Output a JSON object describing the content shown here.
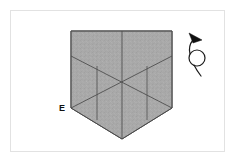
{
  "figure": {
    "background_color": "#ffffff",
    "frame_color": "#e2e2e2"
  },
  "shape": {
    "name": "folded-paper-outline",
    "fill_color": "#a8a8a8",
    "fill_texture": "noise-speckle",
    "stroke_color": "#4a4a4a",
    "outline_points": "71,31 172,31 172,108 122,139 71,108",
    "vertices": [
      {
        "id": "top-left",
        "x": 71,
        "y": 31
      },
      {
        "id": "top-right",
        "x": 172,
        "y": 31
      },
      {
        "id": "right",
        "x": 172,
        "y": 108
      },
      {
        "id": "bottom-apex",
        "x": 122,
        "y": 139
      },
      {
        "id": "left",
        "x": 71,
        "y": 108
      }
    ]
  },
  "fold_lines": [
    {
      "id": "center-vertical",
      "x1": 122,
      "y1": 31,
      "x2": 122,
      "y2": 139
    },
    {
      "id": "diagonal-upper-left-to-center",
      "x1": 71,
      "y1": 56,
      "x2": 172,
      "y2": 108
    },
    {
      "id": "diagonal-upper-right-to-center",
      "x1": 172,
      "y1": 56,
      "x2": 71,
      "y2": 108
    },
    {
      "id": "crease-left-vertical",
      "x1": 97,
      "y1": 66,
      "x2": 97,
      "y2": 120
    },
    {
      "id": "crease-right-vertical",
      "x1": 147,
      "y1": 66,
      "x2": 147,
      "y2": 120
    }
  ],
  "labels": [
    {
      "id": "vertex-label-e",
      "text": "E",
      "x": 62,
      "y": 111
    }
  ],
  "rotation_symbol": {
    "name": "rotate-loop-arrow",
    "stroke_color": "#1a1a1a",
    "arrowhead_color": "#111111",
    "loop_center_x": 197,
    "loop_center_y": 58,
    "loop_radius": 8
  }
}
